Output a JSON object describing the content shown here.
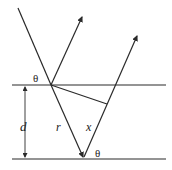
{
  "diagram": {
    "type": "thin-film-reflection",
    "labels": {
      "theta_top": "θ",
      "theta_bottom": "θ",
      "thickness": "d",
      "path_r": "r",
      "path_x": "x"
    },
    "colors": {
      "line": "#2a2a2a",
      "background": "#ffffff"
    }
  }
}
